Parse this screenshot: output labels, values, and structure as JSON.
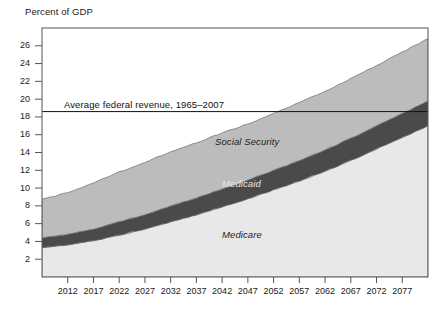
{
  "chart_data": {
    "type": "area",
    "title": "",
    "ylabel": "Percent of GDP",
    "xlabel": "",
    "ylim": [
      0,
      28
    ],
    "xlim": [
      2007,
      2082
    ],
    "grid": false,
    "legend_position": "inline-labels",
    "ytick_labels": [
      "2",
      "4",
      "6",
      "8",
      "10",
      "12",
      "14",
      "16",
      "18",
      "20",
      "22",
      "24",
      "26"
    ],
    "ytick_values": [
      2,
      4,
      6,
      8,
      10,
      12,
      14,
      16,
      18,
      20,
      22,
      24,
      26
    ],
    "xtick_labels": [
      "2012",
      "2017",
      "2022",
      "2027",
      "2032",
      "2037",
      "2042",
      "2047",
      "2052",
      "2057",
      "2062",
      "2067",
      "2072",
      "2077"
    ],
    "xtick_values": [
      2012,
      2017,
      2022,
      2027,
      2032,
      2037,
      2042,
      2047,
      2052,
      2057,
      2062,
      2067,
      2072,
      2077
    ],
    "stacked": true,
    "x": [
      2007,
      2012,
      2017,
      2022,
      2027,
      2032,
      2037,
      2042,
      2047,
      2052,
      2057,
      2062,
      2067,
      2072,
      2077,
      2082
    ],
    "series": [
      {
        "name": "Medicare",
        "color": "#e8e8e8",
        "label": "Medicare",
        "values": [
          3.3,
          3.6,
          4.1,
          4.7,
          5.4,
          6.2,
          7.0,
          7.9,
          8.8,
          9.8,
          10.8,
          11.9,
          13.1,
          14.4,
          15.7,
          17.0
        ]
      },
      {
        "name": "Medicaid",
        "color": "#4a4a4a",
        "label": "Medicaid",
        "values": [
          1.1,
          1.2,
          1.3,
          1.5,
          1.6,
          1.8,
          1.9,
          2.0,
          2.1,
          2.2,
          2.3,
          2.4,
          2.5,
          2.6,
          2.7,
          2.8
        ]
      },
      {
        "name": "Social Security",
        "color": "#bcbcbc",
        "label": "Social Security",
        "values": [
          4.3,
          4.7,
          5.2,
          5.6,
          5.9,
          6.1,
          6.2,
          6.3,
          6.3,
          6.4,
          6.5,
          6.6,
          6.7,
          6.8,
          6.9,
          7.0
        ]
      }
    ],
    "stack_tops": {
      "medicare": [
        3.3,
        3.6,
        4.1,
        4.7,
        5.4,
        6.2,
        7.0,
        7.9,
        8.8,
        9.8,
        10.8,
        11.9,
        13.1,
        14.4,
        15.7,
        17.0
      ],
      "medicaid": [
        4.4,
        4.8,
        5.4,
        6.2,
        7.0,
        8.0,
        8.9,
        9.9,
        10.9,
        12.0,
        13.1,
        14.3,
        15.6,
        17.0,
        18.4,
        19.8
      ],
      "total": [
        8.7,
        9.5,
        10.6,
        11.8,
        12.9,
        14.1,
        15.1,
        16.2,
        17.2,
        18.4,
        19.6,
        20.9,
        22.3,
        23.8,
        25.3,
        26.8
      ]
    },
    "annotations": [
      {
        "name": "average-federal-revenue",
        "text": "Average federal revenue, 1965–2007",
        "type": "hline",
        "value": 18.6
      }
    ]
  },
  "labels": {
    "axis_title": "Percent of GDP",
    "revenue_line": "Average federal revenue, 1965–2007",
    "social_security": "Social Security",
    "medicaid": "Medicaid",
    "medicare": "Medicare"
  }
}
